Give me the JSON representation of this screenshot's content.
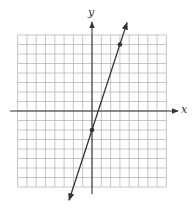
{
  "chart_data": {
    "type": "line",
    "title": "",
    "xlabel": "x",
    "ylabel": "y",
    "xlim": [
      -8,
      8
    ],
    "ylim": [
      -8,
      8
    ],
    "grid": true,
    "grid_step": 1,
    "tick_labels": false,
    "legend": null,
    "series": [
      {
        "name": "line",
        "equation": "y = 3x - 2",
        "slope": 3,
        "intercept": -2,
        "arrows_both_ends": true,
        "marked_points": [
          {
            "x": 0,
            "y": -2
          },
          {
            "x": 3,
            "y": 7
          }
        ]
      }
    ]
  },
  "labels": {
    "x_axis": "x",
    "y_axis": "y"
  },
  "colors": {
    "grid": "#b8b8b8",
    "axis": "#333333",
    "line": "#333333",
    "point": "#333333"
  }
}
